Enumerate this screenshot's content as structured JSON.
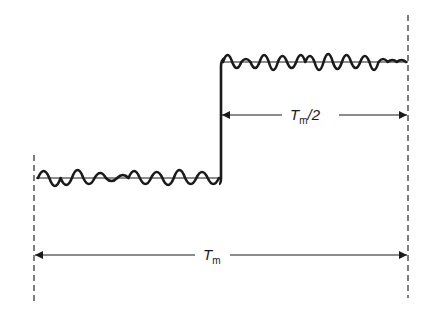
{
  "diagram": {
    "signal": {
      "low_level_label": "",
      "high_level_label": ""
    },
    "annotations": {
      "half_interval": {
        "symbol": "T",
        "subscript": "m",
        "suffix": "/2"
      },
      "full_interval": {
        "symbol": "T",
        "subscript": "m",
        "suffix": ""
      }
    },
    "colors": {
      "ink": "#1a1a1a",
      "dash": "#3a3a3a",
      "background": "#ffffff"
    }
  }
}
